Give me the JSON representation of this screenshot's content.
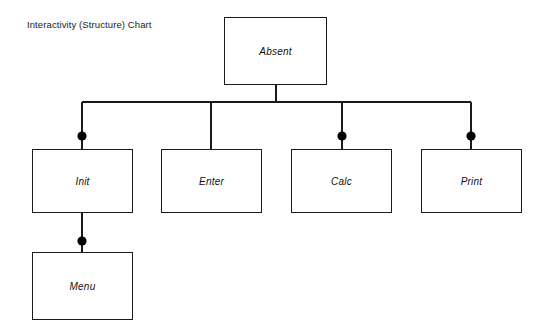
{
  "diagram": {
    "title": "Interactivity (Structure) Chart",
    "background_color": "#ffffff",
    "line_color": "#1a1a1a",
    "text_color": "#111111",
    "marker_color": "#000000",
    "nodes": [
      {
        "id": "absent",
        "label": "Absent",
        "level": 0,
        "x": 224,
        "y": 17,
        "w": 103,
        "h": 68,
        "marker": false
      },
      {
        "id": "init",
        "label": "Init",
        "level": 1,
        "x": 32,
        "y": 149,
        "w": 101,
        "h": 64,
        "marker": true
      },
      {
        "id": "enter",
        "label": "Enter",
        "level": 1,
        "x": 161,
        "y": 149,
        "w": 101,
        "h": 64,
        "marker": false
      },
      {
        "id": "calc",
        "label": "Calc",
        "level": 1,
        "x": 291,
        "y": 149,
        "w": 101,
        "h": 64,
        "marker": true
      },
      {
        "id": "print",
        "label": "Print",
        "level": 1,
        "x": 421,
        "y": 149,
        "w": 101,
        "h": 64,
        "marker": true
      },
      {
        "id": "menu",
        "label": "Menu",
        "level": 2,
        "x": 32,
        "y": 252,
        "w": 101,
        "h": 68,
        "marker": true
      }
    ],
    "connectors": {
      "root_stem": {
        "x": 276,
        "y_top": 85,
        "y_bottom": 102
      },
      "bus": {
        "y": 102,
        "x_left": 82,
        "x_right": 471
      },
      "drops": [
        {
          "to": "init",
          "x": 82,
          "y_top": 102,
          "y_bottom": 149,
          "marker_y": 136,
          "marker": true
        },
        {
          "to": "enter",
          "x": 211,
          "y_top": 102,
          "y_bottom": 149,
          "marker_y": 136,
          "marker": false
        },
        {
          "to": "calc",
          "x": 342,
          "y_top": 102,
          "y_bottom": 149,
          "marker_y": 136,
          "marker": true
        },
        {
          "to": "print",
          "x": 471,
          "y_top": 102,
          "y_bottom": 149,
          "marker_y": 136,
          "marker": true
        }
      ],
      "menu_link": {
        "x": 82,
        "y_top": 213,
        "y_bottom": 252,
        "marker_y": 241,
        "marker": true
      },
      "marker_radius": 4.6
    }
  }
}
